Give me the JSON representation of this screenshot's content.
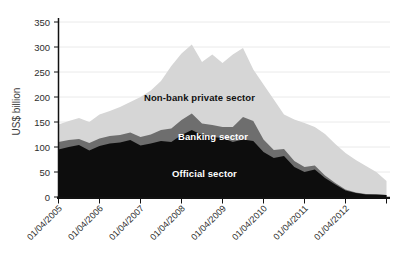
{
  "figure": {
    "y_axis_title": "US$ billion",
    "area_labels": {
      "nonbank": "Non-bank private sector",
      "banking": "Banking sector",
      "official": "Official sector"
    },
    "colors": {
      "official": "#0d0d0d",
      "banking": "#6e6e6e",
      "nonbank": "#d6d6d6",
      "grid": "#eaeaea",
      "axis": "#111111",
      "tick_text": "#2e2e2e"
    }
  },
  "chart_data": {
    "type": "area",
    "stacked": true,
    "title": "",
    "xlabel": "",
    "ylabel": "US$ billion",
    "ylim": [
      0,
      350
    ],
    "grid": true,
    "legend_position": "labels-inside-areas",
    "y_ticks": [
      0,
      50,
      100,
      150,
      200,
      250,
      300,
      350
    ],
    "x": [
      "01/04/2005",
      "01/07/2005",
      "01/10/2005",
      "01/01/2006",
      "01/04/2006",
      "01/07/2006",
      "01/10/2006",
      "01/01/2007",
      "01/04/2007",
      "01/07/2007",
      "01/10/2007",
      "01/01/2008",
      "01/04/2008",
      "01/07/2008",
      "01/10/2008",
      "01/01/2009",
      "01/04/2009",
      "01/07/2009",
      "01/10/2009",
      "01/01/2010",
      "01/04/2010",
      "01/07/2010",
      "01/10/2010",
      "01/01/2011",
      "01/04/2011",
      "01/07/2011",
      "01/10/2011",
      "01/01/2012",
      "01/04/2012",
      "01/07/2012",
      "01/10/2012",
      "01/01/2013",
      "01/04/2013"
    ],
    "x_ticks": [
      {
        "index": 0,
        "label": "01/04/2005"
      },
      {
        "index": 4,
        "label": "01/04/2006"
      },
      {
        "index": 8,
        "label": "01/04/2007"
      },
      {
        "index": 12,
        "label": "01/04/2008"
      },
      {
        "index": 16,
        "label": "01/04/2009"
      },
      {
        "index": 20,
        "label": "01/04/2010"
      },
      {
        "index": 24,
        "label": "01/04/2011"
      },
      {
        "index": 28,
        "label": "01/04/2012"
      },
      {
        "index": 32,
        "label": ""
      }
    ],
    "series": [
      {
        "name": "Official sector",
        "color": "#0d0d0d",
        "values": [
          95,
          100,
          104,
          93,
          102,
          107,
          109,
          114,
          103,
          107,
          112,
          110,
          124,
          134,
          124,
          120,
          118,
          110,
          115,
          112,
          90,
          78,
          82,
          60,
          50,
          55,
          38,
          25,
          13,
          8,
          5,
          5,
          4
        ]
      },
      {
        "name": "Banking sector",
        "color": "#6e6e6e",
        "values": [
          15,
          14,
          12,
          15,
          15,
          15,
          15,
          15,
          17,
          18,
          22,
          27,
          30,
          33,
          23,
          24,
          22,
          30,
          45,
          40,
          25,
          16,
          14,
          12,
          10,
          8,
          5,
          3,
          2,
          1,
          1,
          0,
          0
        ]
      },
      {
        "name": "Non-bank private sector",
        "color": "#d6d6d6",
        "values": [
          35,
          38,
          42,
          42,
          48,
          50,
          56,
          61,
          80,
          88,
          98,
          125,
          133,
          138,
          123,
          141,
          128,
          145,
          138,
          103,
          110,
          101,
          69,
          83,
          88,
          77,
          83,
          78,
          73,
          65,
          56,
          45,
          28
        ]
      }
    ]
  }
}
